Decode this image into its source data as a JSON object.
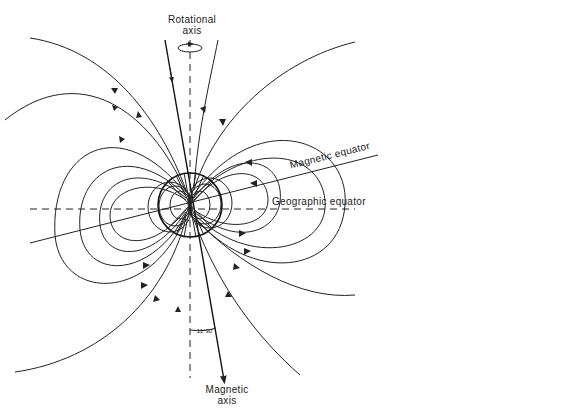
{
  "diagram": {
    "type": "magnetic-dipole-field",
    "labels": {
      "rotational_axis": "Rotational\naxis",
      "rotational_axis_line1": "Rotational",
      "rotational_axis_line2": "axis",
      "magnetic_equator": "Magnetic equator",
      "geographic_equator": "Geographic equator",
      "magnetic_axis_line1": "Magnetic",
      "magnetic_axis_line2": "axis",
      "tilt_angle": "11°30'"
    },
    "elements": {
      "earth_center": [
        190,
        205
      ],
      "earth_radius": 32,
      "rotational_axis": {
        "style": "dashed",
        "x": 190
      },
      "magnetic_axis": {
        "style": "solid",
        "tilt_deg": 11.5
      },
      "geographic_equator": {
        "style": "dashed",
        "y": 209
      },
      "magnetic_equator": {
        "style": "solid",
        "tilt_deg": 11.5
      }
    },
    "colors": {
      "line": "#222222",
      "background": "#ffffff"
    }
  }
}
